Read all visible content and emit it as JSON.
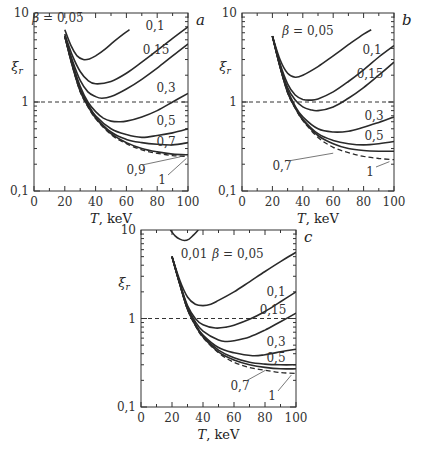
{
  "chart_data": [
    {
      "id": "a",
      "type": "line",
      "panel_label": "a",
      "xlabel": "T,  keV",
      "ylabel": "ξ_r",
      "xlim": [
        0,
        100
      ],
      "ylim": [
        0.1,
        10
      ],
      "yscale": "log",
      "x_ticks": [
        "0",
        "20",
        "40",
        "60",
        "80",
        "100"
      ],
      "y_ticks": [
        "0,1",
        "1",
        "10"
      ],
      "reference_line": {
        "y": 1,
        "style": "dashed"
      },
      "box": {
        "x0": 34,
        "x1": 188,
        "y_top": 13,
        "y_bot": 191
      },
      "series": [
        {
          "name": "β = 0,05",
          "label": "β = 0,05",
          "x": [
            20,
            24,
            28,
            32,
            36,
            40,
            46,
            52,
            58,
            62
          ],
          "values": [
            6.5,
            4.3,
            3.3,
            3.0,
            3.05,
            3.3,
            3.9,
            4.8,
            5.8,
            6.5
          ],
          "label_pos": [
            58,
            22
          ]
        },
        {
          "name": "0,1",
          "label": "0,1",
          "x": [
            20,
            25,
            30,
            35,
            40,
            50,
            60,
            70,
            80,
            90,
            100
          ],
          "values": [
            5.8,
            3.3,
            2.2,
            1.75,
            1.6,
            1.7,
            2.1,
            2.8,
            3.8,
            5.2,
            7.0
          ],
          "label_pos": [
            155,
            30
          ]
        },
        {
          "name": "0,15",
          "label": "0,15",
          "x": [
            20,
            25,
            30,
            35,
            40,
            44,
            50,
            60,
            70,
            80,
            90,
            100
          ],
          "values": [
            5.6,
            2.9,
            1.75,
            1.3,
            1.15,
            1.1,
            1.15,
            1.4,
            1.8,
            2.4,
            3.3,
            4.5
          ],
          "label_pos": [
            156,
            54
          ]
        },
        {
          "name": "0,3",
          "label": "0,3",
          "x": [
            20,
            25,
            30,
            35,
            40,
            45,
            50,
            55,
            60,
            70,
            80,
            90,
            100
          ],
          "values": [
            5.5,
            2.7,
            1.5,
            1.0,
            0.78,
            0.66,
            0.61,
            0.6,
            0.61,
            0.68,
            0.8,
            1.0,
            1.25
          ],
          "label_pos": [
            166,
            92
          ]
        },
        {
          "name": "0,5",
          "label": "0,5",
          "x": [
            20,
            25,
            30,
            35,
            40,
            50,
            60,
            70,
            80,
            90,
            100
          ],
          "values": [
            5.5,
            2.6,
            1.4,
            0.95,
            0.7,
            0.5,
            0.43,
            0.4,
            0.42,
            0.45,
            0.5
          ],
          "label_pos": [
            166,
            125
          ]
        },
        {
          "name": "0,7",
          "label": "0,7",
          "x": [
            20,
            25,
            30,
            35,
            40,
            50,
            60,
            70,
            80,
            90,
            100
          ],
          "values": [
            5.5,
            2.55,
            1.35,
            0.92,
            0.68,
            0.46,
            0.38,
            0.35,
            0.335,
            0.33,
            0.35
          ],
          "label_pos": [
            166,
            146
          ]
        },
        {
          "name": "0,9",
          "label": "0,9",
          "x": [
            20,
            25,
            30,
            35,
            40,
            50,
            60,
            70,
            80,
            90,
            100
          ],
          "values": [
            5.5,
            2.5,
            1.32,
            0.9,
            0.66,
            0.44,
            0.35,
            0.3,
            0.275,
            0.26,
            0.255
          ],
          "label_pos": [
            136,
            174
          ],
          "leader_to": [
            95,
            0.255
          ]
        },
        {
          "name": "1",
          "label": "1",
          "x": [
            20,
            25,
            30,
            35,
            40,
            50,
            60,
            70,
            80,
            90,
            100
          ],
          "values": [
            5.5,
            2.5,
            1.3,
            0.88,
            0.65,
            0.43,
            0.34,
            0.29,
            0.265,
            0.25,
            0.245
          ],
          "dashed": true,
          "label_pos": [
            162,
            184
          ],
          "leader_to": [
            99,
            0.245
          ]
        }
      ]
    },
    {
      "id": "b",
      "type": "line",
      "panel_label": "b",
      "xlabel": "T,  keV",
      "ylabel": "ξ_r",
      "xlim": [
        0,
        100
      ],
      "ylim": [
        0.1,
        10
      ],
      "yscale": "log",
      "x_ticks": [
        "0",
        "20",
        "40",
        "60",
        "80",
        "100"
      ],
      "y_ticks": [
        "0,1",
        "1",
        "10"
      ],
      "reference_line": {
        "y": 1,
        "style": "dashed"
      },
      "box": {
        "x0": 242,
        "x1": 394,
        "y_top": 13,
        "y_bot": 191
      },
      "series": [
        {
          "name": "β = 0,05",
          "label": "β = 0,05",
          "x": [
            20,
            25,
            30,
            35,
            40,
            50,
            60,
            70,
            80,
            85
          ],
          "values": [
            5.5,
            3.0,
            2.1,
            1.9,
            2.0,
            2.5,
            3.3,
            4.4,
            5.8,
            6.5
          ],
          "label_pos": [
            308,
            35
          ]
        },
        {
          "name": "0,1",
          "label": "0,1",
          "x": [
            20,
            25,
            30,
            35,
            40,
            45,
            50,
            60,
            70,
            80,
            90,
            100
          ],
          "values": [
            5.5,
            2.7,
            1.6,
            1.2,
            1.07,
            1.05,
            1.08,
            1.3,
            1.7,
            2.3,
            3.2,
            4.3
          ],
          "label_pos": [
            372,
            54
          ]
        },
        {
          "name": "0,15",
          "label": "0,15",
          "x": [
            20,
            25,
            30,
            35,
            40,
            45,
            50,
            60,
            70,
            80,
            90,
            100
          ],
          "values": [
            5.5,
            2.6,
            1.45,
            1.05,
            0.88,
            0.82,
            0.8,
            0.88,
            1.1,
            1.45,
            2.0,
            2.8
          ],
          "label_pos": [
            370,
            78
          ]
        },
        {
          "name": "0,3",
          "label": "0,3",
          "x": [
            20,
            25,
            30,
            35,
            40,
            50,
            60,
            70,
            80,
            90,
            100
          ],
          "values": [
            5.5,
            2.5,
            1.35,
            0.9,
            0.68,
            0.5,
            0.46,
            0.47,
            0.52,
            0.59,
            0.68
          ],
          "label_pos": [
            374,
            120
          ]
        },
        {
          "name": "0,5",
          "label": "0,5",
          "x": [
            20,
            25,
            30,
            35,
            40,
            50,
            60,
            70,
            80,
            90,
            100
          ],
          "values": [
            5.5,
            2.5,
            1.3,
            0.87,
            0.64,
            0.44,
            0.37,
            0.34,
            0.33,
            0.34,
            0.36
          ],
          "label_pos": [
            374,
            140
          ]
        },
        {
          "name": "0,7",
          "label": "0,7",
          "x": [
            20,
            25,
            30,
            35,
            40,
            50,
            60,
            70,
            80,
            90,
            100
          ],
          "values": [
            5.5,
            2.5,
            1.28,
            0.86,
            0.63,
            0.42,
            0.34,
            0.3,
            0.285,
            0.28,
            0.28
          ],
          "label_pos": [
            282,
            170
          ],
          "leader_to": [
            60,
            0.28
          ]
        },
        {
          "name": "1",
          "label": "1",
          "x": [
            20,
            25,
            30,
            35,
            40,
            50,
            60,
            70,
            80,
            90,
            100
          ],
          "values": [
            5.5,
            2.5,
            1.27,
            0.85,
            0.62,
            0.4,
            0.31,
            0.27,
            0.245,
            0.232,
            0.225
          ],
          "dashed": true,
          "label_pos": [
            370,
            176
          ],
          "leader_to": [
            97,
            0.225
          ]
        }
      ]
    },
    {
      "id": "c",
      "type": "line",
      "panel_label": "c",
      "xlabel": "T,  keV",
      "ylabel": "ξ_r",
      "xlim": [
        0,
        100
      ],
      "ylim": [
        0.1,
        10
      ],
      "yscale": "log",
      "x_ticks": [
        "0",
        "20",
        "40",
        "60",
        "80",
        "100"
      ],
      "y_ticks": [
        "0,1",
        "1",
        "10"
      ],
      "reference_line": {
        "y": 1,
        "style": "dashed"
      },
      "box": {
        "x0": 141,
        "x1": 296,
        "y_top": 230,
        "y_bot": 407
      },
      "series": [
        {
          "name": "0,01",
          "label": "0,01",
          "x": [
            19,
            22,
            25,
            28,
            31,
            34,
            37
          ],
          "values": [
            10,
            8.6,
            7.9,
            7.6,
            7.9,
            8.8,
            10
          ],
          "label_pos": [
            194,
            258
          ]
        },
        {
          "name": "β = 0,05",
          "label": "β = 0,05",
          "x": [
            20,
            25,
            30,
            35,
            40,
            45,
            50,
            60,
            70,
            80,
            90,
            100
          ],
          "values": [
            5.0,
            2.7,
            1.75,
            1.45,
            1.4,
            1.45,
            1.6,
            2.0,
            2.6,
            3.4,
            4.4,
            5.6
          ],
          "label_pos": [
            238,
            258
          ]
        },
        {
          "name": "0,1",
          "label": "0,1",
          "x": [
            20,
            25,
            30,
            35,
            40,
            48,
            55,
            60,
            70,
            80,
            90,
            100
          ],
          "values": [
            5.0,
            2.5,
            1.4,
            1.0,
            0.85,
            0.78,
            0.8,
            0.84,
            0.98,
            1.2,
            1.55,
            2.0
          ],
          "label_pos": [
            276,
            296
          ]
        },
        {
          "name": "0,15",
          "label": "0,15",
          "x": [
            20,
            25,
            30,
            35,
            40,
            50,
            55,
            60,
            70,
            80,
            90,
            100
          ],
          "values": [
            5.0,
            2.5,
            1.35,
            0.92,
            0.72,
            0.57,
            0.55,
            0.56,
            0.62,
            0.74,
            0.92,
            1.15
          ],
          "label_pos": [
            273,
            314
          ]
        },
        {
          "name": "0,3",
          "label": "0,3",
          "x": [
            20,
            25,
            30,
            35,
            40,
            50,
            60,
            72,
            80,
            90,
            100
          ],
          "values": [
            5.0,
            2.45,
            1.3,
            0.87,
            0.65,
            0.47,
            0.41,
            0.38,
            0.39,
            0.42,
            0.45
          ],
          "label_pos": [
            276,
            346
          ]
        },
        {
          "name": "0,5",
          "label": "0,5",
          "x": [
            20,
            25,
            30,
            35,
            40,
            50,
            60,
            70,
            80,
            90,
            100
          ],
          "values": [
            5.0,
            2.45,
            1.28,
            0.85,
            0.63,
            0.44,
            0.36,
            0.32,
            0.305,
            0.3,
            0.3
          ],
          "label_pos": [
            276,
            362
          ]
        },
        {
          "name": "0,7",
          "label": "0,7",
          "x": [
            20,
            25,
            30,
            35,
            40,
            50,
            60,
            70,
            80,
            90,
            100
          ],
          "values": [
            5.0,
            2.45,
            1.27,
            0.84,
            0.62,
            0.42,
            0.34,
            0.3,
            0.28,
            0.27,
            0.27
          ],
          "label_pos": [
            240,
            390
          ],
          "leader_to": [
            80,
            0.272
          ]
        },
        {
          "name": "1",
          "label": "1",
          "x": [
            20,
            25,
            30,
            35,
            40,
            50,
            60,
            70,
            80,
            90,
            100
          ],
          "values": [
            5.0,
            2.45,
            1.26,
            0.83,
            0.61,
            0.41,
            0.32,
            0.28,
            0.26,
            0.245,
            0.24
          ],
          "dashed": true,
          "label_pos": [
            272,
            400
          ],
          "leader_to": [
            97,
            0.242
          ]
        }
      ]
    }
  ]
}
